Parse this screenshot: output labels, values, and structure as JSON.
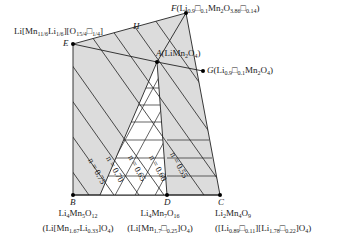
{
  "diagram": {
    "type": "compositional phase diagram (Li-Mn-O spinel region)",
    "colors": {
      "region_fill": "#dcdcdc",
      "triangle_fill": "#ffffff",
      "line": "#222222",
      "point": "#000000"
    },
    "points": {
      "E": {
        "letter": "E",
        "label": "Li[Mn11/6Li1/6][O15/4□1/4]"
      },
      "F": {
        "letter": "F",
        "label": "(Li0.9□0.1Mn2O3.86□0.14)"
      },
      "A": {
        "letter": "A",
        "label": "(LiMn2O4)"
      },
      "G": {
        "letter": "G",
        "label": "(Li0.9□0.1Mn2O4)"
      },
      "H": {
        "letter": "H"
      },
      "B": {
        "letter": "B",
        "line1": "Li4Mn5O12",
        "line2": "(Li[Mn1.67Li0.33]O4)"
      },
      "D": {
        "letter": "D",
        "line1": "Li4Mn7O16",
        "line2": "(Li[Mn1.7□0.25]O4)"
      },
      "C": {
        "letter": "C",
        "line1": "Li2Mn4O9",
        "line2": "([Li0.89□0.11][Li1.78□0.22]O4)"
      }
    },
    "n_lines": [
      "n = 0.75",
      "n = 0.70",
      "n = 0.65",
      "n = 0.60",
      "n = 0.55"
    ]
  }
}
